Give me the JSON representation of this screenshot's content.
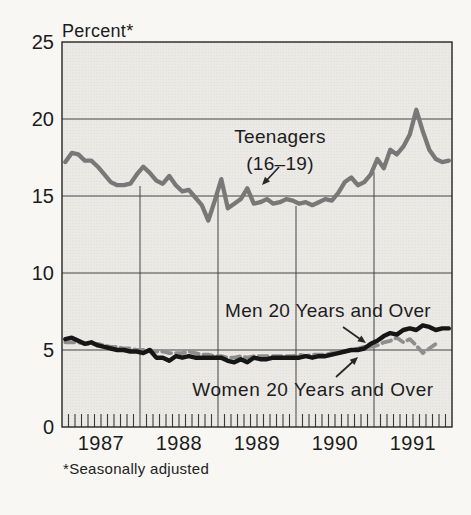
{
  "chart_data": {
    "type": "line",
    "ylabel": "Percent*",
    "footnote": "*Seasonally adjusted",
    "x_start": "1987-01",
    "x_end": "1991-12",
    "frequency": "monthly",
    "x_months": 60,
    "x_tick_labels": [
      "1987",
      "1988",
      "1989",
      "1990",
      "1991"
    ],
    "y_ticks": [
      0,
      5,
      10,
      15,
      20,
      25
    ],
    "ylim": [
      0,
      25
    ],
    "grid": true,
    "legend_position": "inline-annotations",
    "annotations": {
      "teenagers_line1": "Teenagers",
      "teenagers_line2": "(16–19)",
      "men": "Men 20 Years and Over",
      "women": "Women 20 Years and Over"
    },
    "colors": {
      "teenagers": "#787878",
      "men": "#161616",
      "women": "#8e8e8e",
      "grid": "#454545",
      "frame": "#242424",
      "plot_background": "#eceae6",
      "text": "#1c1c1c"
    },
    "series": [
      {
        "key": "teenagers",
        "name": "Teenagers (16–19)",
        "style": "solid",
        "color": "#787878",
        "values": [
          17.2,
          17.8,
          17.7,
          17.3,
          17.3,
          16.9,
          16.4,
          15.9,
          15.7,
          15.7,
          15.8,
          16.4,
          16.9,
          16.5,
          16.0,
          15.8,
          16.3,
          15.7,
          15.3,
          15.4,
          14.9,
          14.4,
          13.4,
          14.7,
          16.1,
          14.2,
          14.5,
          14.8,
          15.5,
          14.5,
          14.6,
          14.8,
          14.5,
          14.6,
          14.8,
          14.7,
          14.5,
          14.6,
          14.4,
          14.6,
          14.8,
          14.7,
          15.2,
          15.9,
          16.2,
          15.7,
          15.9,
          16.4,
          17.4,
          16.8,
          18.0,
          17.7,
          18.2,
          19.0,
          20.6,
          19.2,
          18.0,
          17.4,
          17.2,
          17.3
        ]
      },
      {
        "key": "men",
        "name": "Men 20 Years and Over",
        "style": "solid",
        "color": "#161616",
        "values": [
          5.7,
          5.8,
          5.6,
          5.4,
          5.5,
          5.3,
          5.2,
          5.1,
          5.0,
          5.0,
          4.9,
          4.9,
          4.8,
          5.0,
          4.5,
          4.5,
          4.3,
          4.6,
          4.5,
          4.6,
          4.5,
          4.5,
          4.5,
          4.5,
          4.5,
          4.3,
          4.2,
          4.4,
          4.2,
          4.5,
          4.4,
          4.4,
          4.5,
          4.5,
          4.5,
          4.5,
          4.5,
          4.6,
          4.5,
          4.6,
          4.6,
          4.7,
          4.8,
          4.9,
          5.0,
          5.0,
          5.1,
          5.4,
          5.6,
          5.9,
          6.1,
          6.0,
          6.3,
          6.4,
          6.3,
          6.6,
          6.5,
          6.3,
          6.4,
          6.4
        ]
      },
      {
        "key": "women",
        "name": "Women 20 Years and Over",
        "style": "dashed",
        "color": "#8e8e8e",
        "values": [
          5.5,
          5.5,
          5.5,
          5.4,
          5.4,
          5.4,
          5.3,
          5.2,
          5.2,
          5.1,
          5.1,
          5.0,
          5.0,
          5.0,
          4.9,
          4.9,
          4.8,
          4.8,
          4.8,
          4.9,
          4.8,
          4.7,
          4.7,
          4.6,
          4.6,
          4.5,
          4.5,
          4.6,
          4.5,
          4.6,
          4.6,
          4.6,
          4.6,
          4.6,
          4.6,
          4.6,
          4.7,
          4.6,
          4.7,
          4.7,
          4.7,
          4.8,
          4.8,
          4.9,
          5.0,
          5.1,
          5.2,
          5.2,
          5.3,
          5.5,
          5.6,
          5.8,
          5.5,
          5.7,
          5.3,
          4.8,
          5.1,
          5.4
        ]
      }
    ]
  }
}
